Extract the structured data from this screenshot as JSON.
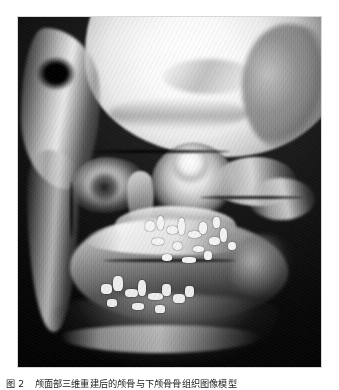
{
  "document": {
    "background_color": "#ffffff",
    "width": 339,
    "height": 390
  },
  "figure": {
    "image_name": "skull-3d-ct-volume-rendering",
    "modality": "CT 3D volume reconstruction",
    "colorspace": "grayscale",
    "frame": {
      "x": 18,
      "y": 17,
      "width": 303,
      "height": 350
    },
    "background_color": "#050505",
    "bone_highlight_color": "#ffffff",
    "bone_midtone_color": "#b4b4b4",
    "shadow_color": "#141414",
    "anatomy_visible": [
      "cranial vault",
      "frontal bone",
      "left temporal region",
      "external auditory canal void",
      "orbital floor",
      "nasal septum",
      "zygomatic arch",
      "maxilla",
      "hard palate",
      "mandibular body",
      "mandibular ramus",
      "mandibular angle",
      "dental arch fragments"
    ],
    "view": "anteroinferior oblique"
  },
  "caption": {
    "label": "图 2",
    "text": "颅面部三维重建后的颅骨与下颅骨骨组织图像模型",
    "color": "#1b1b1b"
  }
}
